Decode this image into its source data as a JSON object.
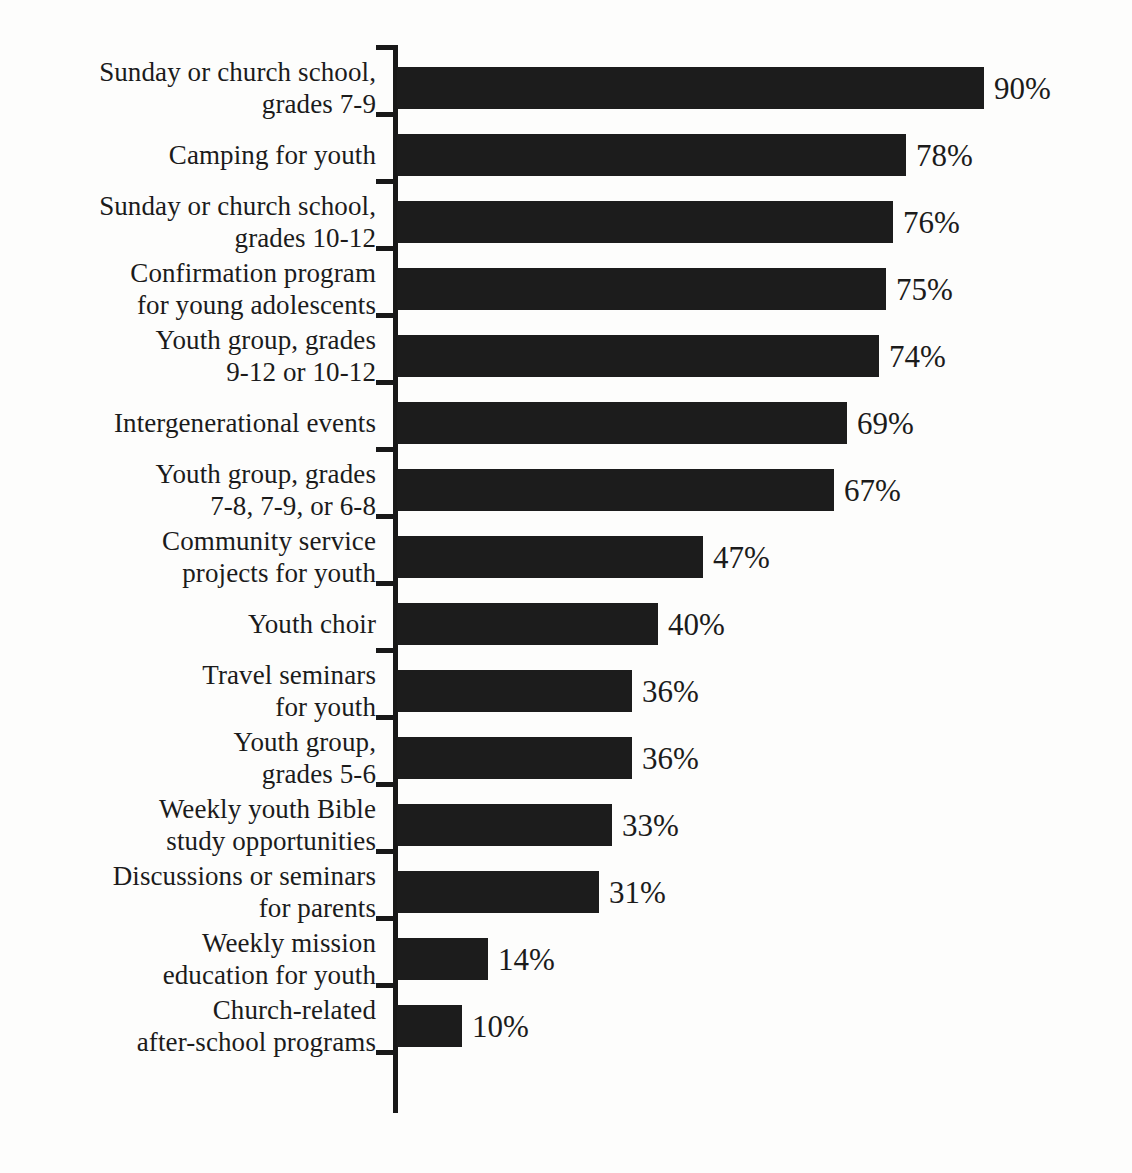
{
  "chart_data": {
    "type": "bar",
    "orientation": "horizontal",
    "title": "",
    "subtitle": "",
    "xlabel": "",
    "ylabel": "",
    "xlim": [
      0,
      100
    ],
    "grid": false,
    "legend": null,
    "value_suffix": "%",
    "categories": [
      "Sunday or church school,\ngrades 7-9",
      "Camping for youth",
      "Sunday or church school,\ngrades 10-12",
      "Confirmation program\nfor young adolescents",
      "Youth group, grades\n9-12 or 10-12",
      "Intergenerational events",
      "Youth group, grades\n7-8, 7-9, or 6-8",
      "Community service\nprojects for youth",
      "Youth choir",
      "Travel seminars\nfor youth",
      "Youth group,\ngrades 5-6",
      "Weekly youth Bible\nstudy opportunities",
      "Discussions or seminars\nfor parents",
      "Weekly mission\neducation for youth",
      "Church-related\nafter-school programs"
    ],
    "values": [
      90,
      78,
      76,
      75,
      74,
      69,
      67,
      47,
      40,
      36,
      36,
      33,
      31,
      14,
      10
    ],
    "value_labels": [
      "90%",
      "78%",
      "76%",
      "75%",
      "74%",
      "69%",
      "67%",
      "47%",
      "40%",
      "36%",
      "36%",
      "33%",
      "31%",
      "14%",
      "10%"
    ],
    "colors": {
      "bar": "#1c1c1c",
      "axis": "#181818",
      "text": "#1b1b1b",
      "background": "#fdfdfc"
    }
  }
}
